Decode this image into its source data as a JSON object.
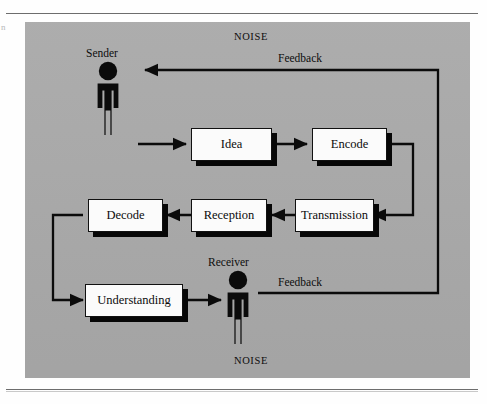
{
  "page": {
    "margin_artifact": "n",
    "background_color": "#a9a9a9",
    "line_color": "#0b0b0b",
    "box_fill": "#fbfbfb",
    "shadow_color": "#070707"
  },
  "diagram": {
    "noise_top": "NOISE",
    "noise_bottom": "NOISE",
    "actors": [
      {
        "id": "sender",
        "label": "Sender"
      },
      {
        "id": "receiver",
        "label": "Receiver"
      }
    ],
    "nodes": [
      {
        "id": "idea",
        "label": "Idea"
      },
      {
        "id": "encode",
        "label": "Encode"
      },
      {
        "id": "transmission",
        "label": "Transmission"
      },
      {
        "id": "reception",
        "label": "Reception"
      },
      {
        "id": "decode",
        "label": "Decode"
      },
      {
        "id": "understanding",
        "label": "Understanding"
      }
    ],
    "feedback_labels": [
      {
        "id": "feedback-top",
        "label": "Feedback"
      },
      {
        "id": "feedback-bottom",
        "label": "Feedback"
      }
    ],
    "flow": [
      {
        "from": "sender",
        "to": "idea"
      },
      {
        "from": "idea",
        "to": "encode"
      },
      {
        "from": "encode",
        "to": "transmission"
      },
      {
        "from": "transmission",
        "to": "reception"
      },
      {
        "from": "reception",
        "to": "decode"
      },
      {
        "from": "decode",
        "to": "understanding"
      },
      {
        "from": "understanding",
        "to": "receiver"
      },
      {
        "from": "receiver",
        "to": "sender",
        "kind": "feedback"
      }
    ]
  }
}
